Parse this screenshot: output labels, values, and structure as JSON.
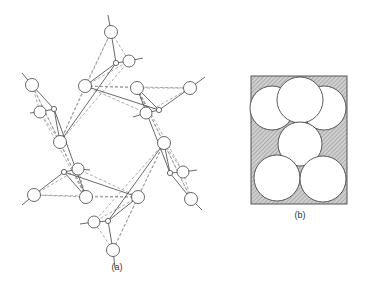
{
  "figure_a": {
    "label": "(a)",
    "description": "Six-membered silicate ring: SiO4 tetrahedra sharing corners",
    "colors": {
      "stroke": "#444444",
      "dashed": "#888888",
      "atom_fill": "#ffffff"
    },
    "silicon_atoms": [
      {
        "x": 116,
        "y": 63
      },
      {
        "x": 159,
        "y": 110
      },
      {
        "x": 170,
        "y": 173
      },
      {
        "x": 108,
        "y": 221
      },
      {
        "x": 64,
        "y": 172
      },
      {
        "x": 54,
        "y": 109
      }
    ],
    "bridging_oxygens": [
      {
        "x": 85,
        "y": 86
      },
      {
        "x": 137,
        "y": 88
      },
      {
        "x": 164,
        "y": 143
      },
      {
        "x": 138,
        "y": 197
      },
      {
        "x": 86,
        "y": 197
      },
      {
        "x": 60,
        "y": 142
      }
    ],
    "apical_oxygens": [
      {
        "x": 111,
        "y": 32,
        "tx": 108,
        "ty": 15
      },
      {
        "x": 190,
        "y": 88,
        "tx": 205,
        "ty": 77
      },
      {
        "x": 191,
        "y": 199,
        "tx": 202,
        "ty": 210
      },
      {
        "x": 113,
        "y": 250,
        "tx": 115,
        "ty": 268
      },
      {
        "x": 34,
        "y": 195,
        "tx": 22,
        "ty": 205
      },
      {
        "x": 32,
        "y": 85,
        "tx": 22,
        "ty": 73
      }
    ],
    "side_oxygens": [
      {
        "x": 129,
        "y": 61,
        "tx": 143,
        "ty": 58
      },
      {
        "x": 146,
        "y": 113,
        "tx": 133,
        "ty": 117
      },
      {
        "x": 183,
        "y": 172,
        "tx": 197,
        "ty": 170
      },
      {
        "x": 94,
        "y": 222,
        "tx": 80,
        "ty": 224
      },
      {
        "x": 78,
        "y": 169,
        "tx": 90,
        "ty": 170
      },
      {
        "x": 40,
        "y": 112,
        "tx": 30,
        "ty": 113
      }
    ]
  },
  "figure_b": {
    "label": "(b)",
    "description": "Close-packed spheres view of ring cross-section",
    "colors": {
      "hatch": "#9a9a9a",
      "background": "#c8c8c8",
      "border": "#555555",
      "sphere_fill": "#ffffff"
    },
    "frame": {
      "x": 251,
      "y": 76,
      "w": 96,
      "h": 128
    },
    "spheres": [
      {
        "cx": 272,
        "cy": 108,
        "r": 22
      },
      {
        "cx": 324,
        "cy": 108,
        "r": 22
      },
      {
        "cx": 300,
        "cy": 100,
        "r": 23
      },
      {
        "cx": 300,
        "cy": 144,
        "r": 22
      },
      {
        "cx": 277,
        "cy": 178,
        "r": 23
      },
      {
        "cx": 323,
        "cy": 179,
        "r": 23
      }
    ]
  }
}
